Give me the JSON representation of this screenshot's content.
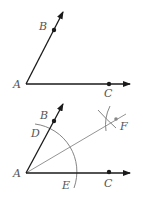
{
  "figure1": {
    "labels": {
      "A": "A",
      "B": "B",
      "C": "C"
    }
  },
  "figure2": {
    "labels": {
      "A": "A",
      "B": "B",
      "C": "C",
      "D": "D",
      "E": "E",
      "F": "F"
    }
  },
  "colors": {
    "ray": "#1a1a1a",
    "construction": "#888888",
    "label": "#555555"
  }
}
